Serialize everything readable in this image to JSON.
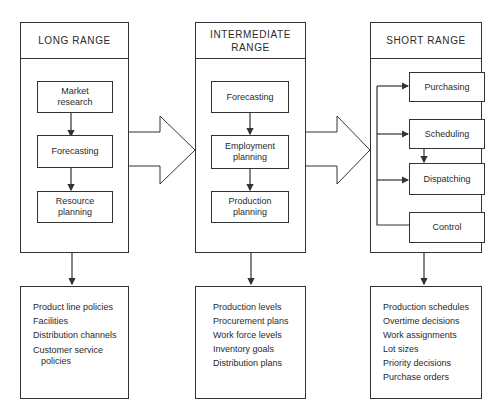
{
  "columns": [
    {
      "title": "LONG RANGE",
      "steps": [
        "Market research",
        "Forecasting",
        "Resource planning"
      ],
      "outputs": [
        "Product line policies",
        "Facilities",
        "Distribution channels",
        "Customer service",
        "policies"
      ]
    },
    {
      "title": "INTERMEDIATE RANGE",
      "steps": [
        "Forecasting",
        "Employment planning",
        "Production planning"
      ],
      "outputs": [
        "Production levels",
        "Procurement plans",
        "Work force levels",
        "Inventory goals",
        "Distribution plans"
      ]
    },
    {
      "title": "SHORT RANGE",
      "steps": [
        "Purchasing",
        "Scheduling",
        "Dispatching",
        "Control"
      ],
      "outputs": [
        "Production schedules",
        "Overtime decisions",
        "Work assignments",
        "Lot sizes",
        "Priority decisions",
        "Purchase orders"
      ]
    }
  ],
  "labels": {
    "long_title": "LONG RANGE",
    "inter_title_1": "INTERMEDIATE",
    "inter_title_2": "RANGE",
    "short_title": "SHORT RANGE",
    "market_1": "Market",
    "market_2": "research",
    "forecasting": "Forecasting",
    "resource_1": "Resource",
    "resource_2": "planning",
    "employment_1": "Employment",
    "employment_2": "planning",
    "production_1": "Production",
    "production_2": "planning",
    "purchasing": "Purchasing",
    "scheduling": "Scheduling",
    "dispatching": "Dispatching",
    "control": "Control"
  },
  "colors": {
    "line": "#333333",
    "background": "#ffffff",
    "text": "#2a2a2a"
  }
}
